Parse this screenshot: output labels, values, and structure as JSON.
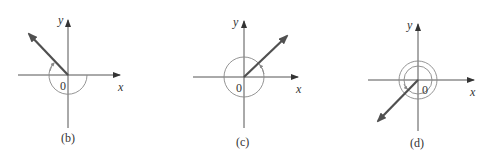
{
  "figure": {
    "panels": [
      {
        "id": "b",
        "caption": "(b)",
        "origin_label": "0",
        "x_label": "x",
        "y_label": "y",
        "vector_angle_deg": 135,
        "rotation": "counterclockwise angle with a negative-direction arc wrapping below the x-axis",
        "arc_count": 1
      },
      {
        "id": "c",
        "caption": "(c)",
        "origin_label": "0",
        "x_label": "x",
        "y_label": "y",
        "vector_angle_deg": 45,
        "rotation": "full circle plus 45 degrees",
        "arc_count": 1
      },
      {
        "id": "d",
        "caption": "(d)",
        "origin_label": "0",
        "x_label": "x",
        "y_label": "y",
        "vector_angle_deg": 225,
        "rotation": "double concentric arcs ending in third quadrant",
        "arc_count": 2
      }
    ],
    "colors": {
      "axis": "#555555",
      "vector": "#505050",
      "arc": "#888888",
      "background": "#ffffff"
    }
  }
}
